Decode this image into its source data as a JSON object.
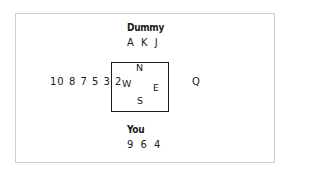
{
  "north": {
    "label": "Dummy",
    "cards": "A K J"
  },
  "south": {
    "label": "You",
    "cards": "9 6 4"
  },
  "west": {
    "cards": "10 8 7 5 3 2"
  },
  "east": {
    "cards": "Q"
  },
  "compass": {
    "n": "N",
    "s": "S",
    "w": "W",
    "e": "E"
  }
}
